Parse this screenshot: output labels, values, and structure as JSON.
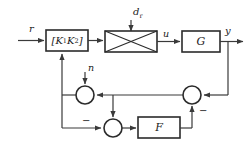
{
  "diagram": {
    "colors": {
      "background": "#ffffff",
      "line": "#3a3a3a",
      "block_border": "#2b2b2b",
      "block_fill": "#ffffff",
      "text": "#1a1a1a"
    },
    "blocks": [
      {
        "id": "controller",
        "label": "[K",
        "sub1": "1",
        "label2": "K",
        "sub2": "2",
        "label3": "]"
      },
      {
        "id": "disturbance-mixer",
        "label": ""
      },
      {
        "id": "plant",
        "label": "G"
      },
      {
        "id": "filter",
        "label": "F"
      }
    ],
    "labels": {
      "reference_input": "r",
      "disturbance": "d",
      "disturbance_sub": "r",
      "control_signal": "u",
      "plant_name": "G",
      "output": "y",
      "noise": "n",
      "filter_name": "F",
      "controller_open": "[",
      "controller_k1": "K",
      "controller_k1_sub": "1",
      "controller_k2": "K",
      "controller_k2_sub": "2",
      "controller_close": "]",
      "minus_bottom": "−",
      "minus_right": "−"
    }
  }
}
